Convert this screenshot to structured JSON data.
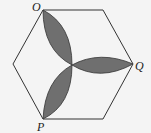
{
  "diagram": {
    "labels": {
      "O": "O",
      "Q": "Q",
      "P": "P"
    },
    "colors": {
      "stroke": "#333333",
      "petal_fill": "#6f6f6f",
      "background": "#f4f4f4"
    }
  }
}
